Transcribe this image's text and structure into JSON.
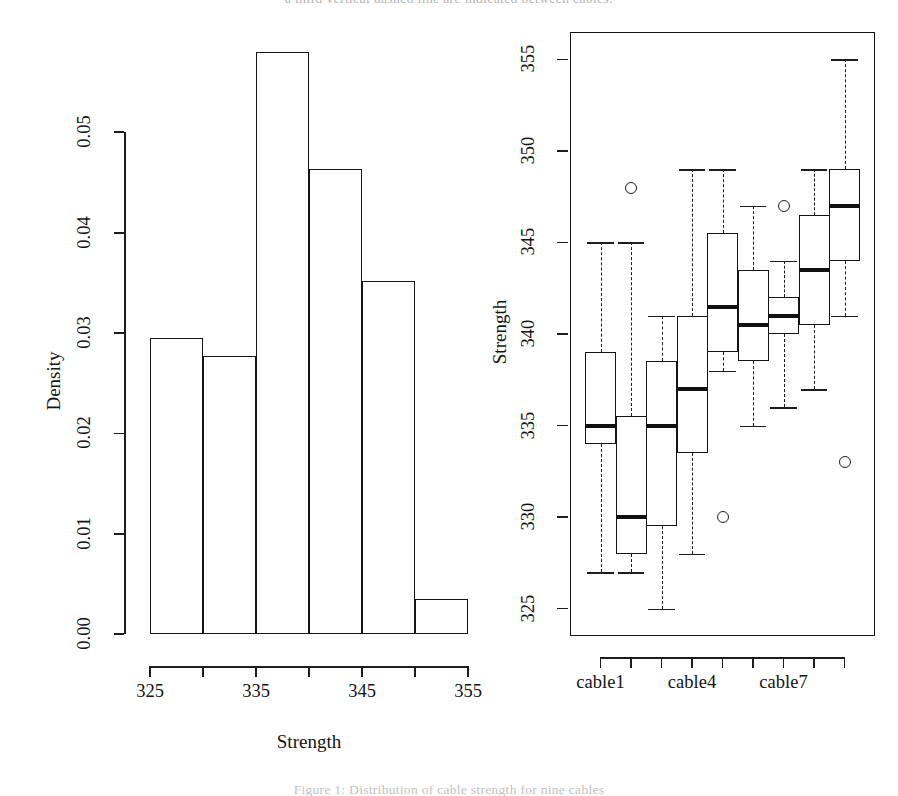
{
  "page": {
    "header_text": "a third vertical dashed line are indicated between cables.",
    "caption_text": "Figure 1: Distribution of cable strength for nine cables"
  },
  "chart_data": [
    {
      "type": "bar",
      "name": "strength-histogram",
      "title": "",
      "xlabel": "Strength",
      "ylabel": "Density",
      "xlim": [
        325,
        355
      ],
      "ylim": [
        0.0,
        0.058
      ],
      "x_ticks": [
        325,
        330,
        335,
        340,
        345,
        350,
        355
      ],
      "x_tick_labels": [
        "325",
        "",
        "335",
        "",
        "345",
        "",
        "355"
      ],
      "y_ticks": [
        0.0,
        0.01,
        0.02,
        0.03,
        0.04,
        0.05
      ],
      "y_tick_labels": [
        "0.00",
        "0.01",
        "0.02",
        "0.03",
        "0.04",
        "0.05"
      ],
      "bin_width": 5,
      "bin_edges": [
        325,
        330,
        335,
        340,
        345,
        350,
        355
      ],
      "categories": [
        "325-330",
        "330-335",
        "335-340",
        "340-345",
        "345-350",
        "350-355"
      ],
      "values": [
        0.0295,
        0.0277,
        0.058,
        0.0463,
        0.0352,
        0.0035
      ],
      "grid": false,
      "legend": "none"
    },
    {
      "type": "boxplot",
      "name": "strength-by-cable-boxplot",
      "title": "",
      "xlabel": "",
      "ylabel": "Strength",
      "ylim": [
        323.5,
        356.5
      ],
      "y_ticks": [
        325,
        330,
        335,
        340,
        345,
        350,
        355
      ],
      "y_tick_labels": [
        "325",
        "330",
        "335",
        "340",
        "345",
        "350",
        "355"
      ],
      "x_ticks": [
        1,
        2,
        3,
        4,
        5,
        6,
        7,
        8,
        9
      ],
      "x_tick_labels": [
        "cable1",
        "",
        "",
        "cable4",
        "",
        "",
        "cable7",
        "",
        ""
      ],
      "grid": false,
      "legend": "none",
      "boxes": [
        {
          "label": "cable1",
          "whisker_low": 327,
          "q1": 334,
          "median": 335,
          "q3": 339,
          "whisker_high": 345,
          "outliers": []
        },
        {
          "label": "cable2",
          "whisker_low": 327,
          "q1": 328,
          "median": 330,
          "q3": 335.5,
          "whisker_high": 345,
          "outliers": [
            348
          ]
        },
        {
          "label": "cable3",
          "whisker_low": 325,
          "q1": 329.5,
          "median": 335,
          "q3": 338.5,
          "whisker_high": 341,
          "outliers": []
        },
        {
          "label": "cable4",
          "whisker_low": 328,
          "q1": 333.5,
          "median": 337,
          "q3": 341,
          "whisker_high": 349,
          "outliers": []
        },
        {
          "label": "cable5",
          "whisker_low": 338,
          "q1": 339,
          "median": 341.5,
          "q3": 345.5,
          "whisker_high": 349,
          "outliers": [
            330
          ]
        },
        {
          "label": "cable6",
          "whisker_low": 335,
          "q1": 338.5,
          "median": 340.5,
          "q3": 343.5,
          "whisker_high": 347,
          "outliers": []
        },
        {
          "label": "cable7",
          "whisker_low": 336,
          "q1": 340,
          "median": 341,
          "q3": 342,
          "whisker_high": 344,
          "outliers": [
            347
          ]
        },
        {
          "label": "cable8",
          "whisker_low": 337,
          "q1": 340.5,
          "median": 343.5,
          "q3": 346.5,
          "whisker_high": 349,
          "outliers": []
        },
        {
          "label": "cable9",
          "whisker_low": 341,
          "q1": 344,
          "median": 347,
          "q3": 349,
          "whisker_high": 355,
          "outliers": [
            333
          ]
        }
      ]
    }
  ]
}
